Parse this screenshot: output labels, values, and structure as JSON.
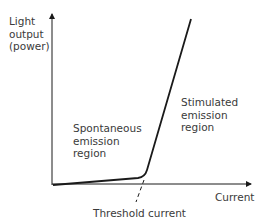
{
  "diagram": {
    "y_axis_label": [
      "Light",
      "output",
      "(power)"
    ],
    "x_axis_label": "Current",
    "regions": {
      "spontaneous": [
        "Spontaneous",
        "emission",
        "region"
      ],
      "stimulated": [
        "Stimulated",
        "emission",
        "region"
      ]
    },
    "threshold_label": "Threshold current",
    "colors": {
      "line": "#1a1a1a",
      "text": "#3a3a3a",
      "background": "#ffffff"
    }
  }
}
